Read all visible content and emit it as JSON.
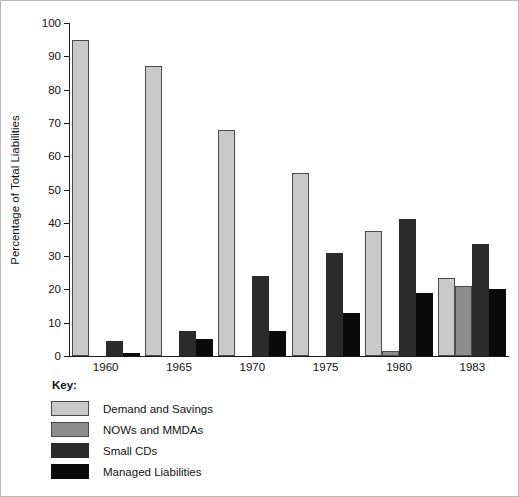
{
  "chart_data": {
    "type": "bar",
    "title": "",
    "xlabel": "",
    "ylabel": "Percentage of Total Liabilities",
    "ylim": [
      0,
      100
    ],
    "yticks": [
      0,
      10,
      20,
      30,
      40,
      50,
      60,
      70,
      80,
      90,
      100
    ],
    "grid": false,
    "legend_position": "below-left",
    "legend_title": "Key:",
    "categories": [
      "1960",
      "1965",
      "1970",
      "1975",
      "1980",
      "1983"
    ],
    "series": [
      {
        "name": "Demand and Savings",
        "color": "#c9c9c9",
        "values": [
          95,
          87,
          68,
          55,
          37.5,
          23.5
        ]
      },
      {
        "name": "NOWs and MMDAs",
        "color": "#8d8d8d",
        "values": [
          0,
          0,
          0,
          0,
          1.5,
          21
        ]
      },
      {
        "name": "Small CDs",
        "color": "#2b2b2b",
        "values": [
          4.5,
          7.5,
          24,
          31,
          41,
          33.5
        ]
      },
      {
        "name": "Managed Liabilities",
        "color": "#0a0a0a",
        "values": [
          1,
          5,
          7.5,
          13,
          19,
          20
        ]
      }
    ]
  }
}
